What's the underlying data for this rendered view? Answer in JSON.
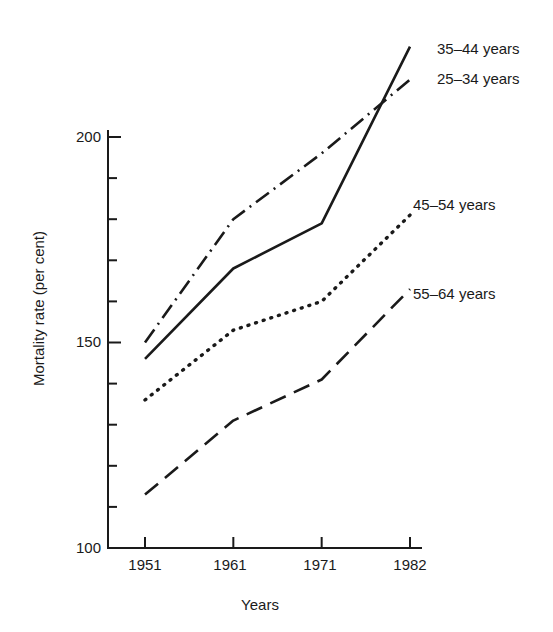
{
  "chart_data": {
    "type": "line",
    "title": "",
    "subtitle": "",
    "xlabel": "Years",
    "ylabel": "Mortality rate (per cent)",
    "x": [
      1951,
      1961,
      1971,
      1982
    ],
    "xtick_labels": [
      "1951",
      "1961",
      "1971",
      "1982"
    ],
    "ytick_labels": [
      "100",
      "150",
      "200"
    ],
    "ytick_values": [
      100,
      150,
      200
    ],
    "yminor_step": 10,
    "xlim": [
      1951,
      1982
    ],
    "ylim": [
      100,
      222
    ],
    "grid": false,
    "legend_position": "right-inline-labels",
    "series": [
      {
        "name": "35–44 years",
        "style": "solid",
        "values": [
          146,
          168,
          179,
          222
        ]
      },
      {
        "name": "25–34 years",
        "style": "dash-dot",
        "values": [
          150,
          180,
          196,
          214
        ]
      },
      {
        "name": "45–54 years",
        "style": "dotted",
        "values": [
          136,
          153,
          160,
          181
        ]
      },
      {
        "name": "55–64 years",
        "style": "dashed",
        "values": [
          113,
          131,
          141,
          163
        ]
      }
    ],
    "annotations": [
      {
        "text": "35–44 years",
        "series": "35–44 years"
      },
      {
        "text": "25–34 years",
        "series": "25–34 years"
      },
      {
        "text": "45–54 years",
        "series": "45–54 years"
      },
      {
        "text": "55–64 years",
        "series": "55–64 years"
      }
    ],
    "colors": {
      "axis": "#1a1a1a",
      "line": "#1a1a1a",
      "background": "#ffffff"
    }
  },
  "axes": {
    "y_title": "Mortality rate (per cent)",
    "x_title": "Years",
    "y_ticks": [
      "200",
      "150",
      "100"
    ],
    "x_ticks": [
      "1951",
      "1961",
      "1971",
      "1982"
    ]
  },
  "labels": {
    "s1": "35–44 years",
    "s2": "25–34 years",
    "s3": "45–54 years",
    "s4": "55–64 years"
  }
}
